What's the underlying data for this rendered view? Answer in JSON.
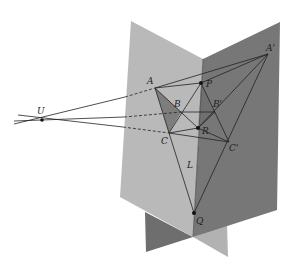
{
  "diagram": {
    "colors": {
      "left_plane": "#b9b9b9",
      "right_plane": "#777777",
      "lower_left_plane": "#6e6e6e",
      "lower_right_plane": "#b2b2b2",
      "triangle_fill": "#7d7d7d",
      "line": "#222222"
    },
    "labels": {
      "U": "U",
      "A": "A",
      "B": "B",
      "C": "C",
      "A_prime": "A'",
      "B_prime": "B'",
      "C_prime": "C'",
      "P": "P",
      "R": "R",
      "Q": "Q",
      "L": "L"
    }
  }
}
